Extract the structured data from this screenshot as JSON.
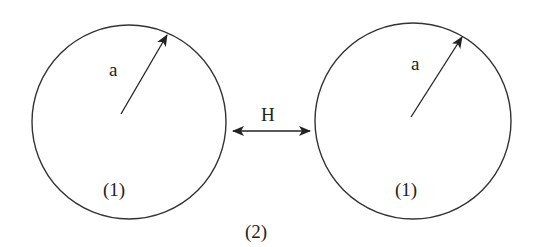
{
  "diagram": {
    "left_sphere": {
      "radius_label": "a",
      "region_label": "(1)"
    },
    "right_sphere": {
      "radius_label": "a",
      "region_label": "(1)"
    },
    "gap": {
      "label": "H"
    },
    "medium_label": "(2)",
    "colors": {
      "stroke": "#333333",
      "background": "#ffffff"
    }
  }
}
